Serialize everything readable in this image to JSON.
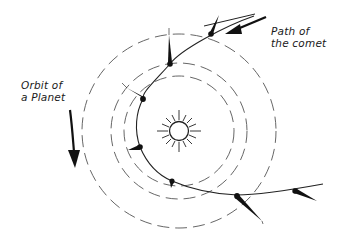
{
  "diagram": {
    "labels": {
      "comet_path_line1": "Path of",
      "comet_path_line2": "the comet",
      "planet_orbit_line1": "Orbit of",
      "planet_orbit_line2": "a Planet"
    },
    "sun": {
      "cx": 179,
      "cy": 131,
      "r": 10
    },
    "orbits": [
      {
        "name": "outer-orbit",
        "r": 97
      },
      {
        "name": "middle-orbit",
        "r": 68
      },
      {
        "name": "inner-orbit",
        "r": 55
      }
    ],
    "comet_positions": 7,
    "colors": {
      "ink": "#111111",
      "orbit": "#555555",
      "background": "#ffffff"
    }
  }
}
